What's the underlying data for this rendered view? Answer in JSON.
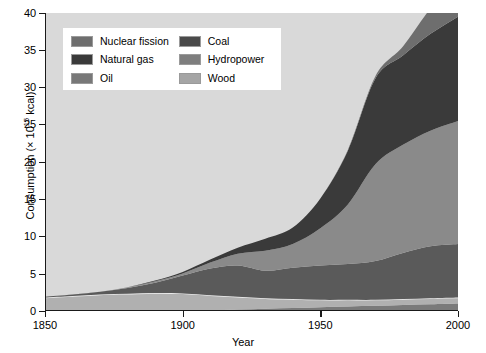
{
  "chart_data": {
    "type": "area",
    "title": "",
    "subtitle": "",
    "xlabel": "Year",
    "ylabel": "Consumption (× 10¹⁵ kcal)",
    "ylabel_prefix": "Consumption (× 10",
    "ylabel_exponent": "15",
    "ylabel_suffix": " kcal)",
    "xlim": [
      1850,
      2000
    ],
    "ylim": [
      0,
      40
    ],
    "xticks": [
      1850,
      1900,
      1950,
      2000
    ],
    "yticks": [
      0,
      5,
      10,
      15,
      20,
      25,
      30,
      35,
      40
    ],
    "grid": false,
    "stacked": true,
    "legend_position": "top-left-inside",
    "plot_background": "#d9d9d9",
    "x": [
      1850,
      1860,
      1870,
      1880,
      1890,
      1900,
      1910,
      1920,
      1930,
      1940,
      1950,
      1960,
      1970,
      1980,
      1990,
      2000
    ],
    "stack_order_bottom_to_top": [
      "Hydropower",
      "Wood",
      "Coal",
      "Oil",
      "Natural gas",
      "Nuclear fission"
    ],
    "series": [
      {
        "name": "Nuclear fission",
        "color": "#6e6e6e",
        "values": [
          0,
          0,
          0,
          0,
          0,
          0,
          0,
          0,
          0,
          0,
          0,
          0.1,
          0.3,
          1.2,
          3.4,
          5.0
        ]
      },
      {
        "name": "Natural gas",
        "color": "#3a3a3a",
        "values": [
          0,
          0,
          0,
          0,
          0.1,
          0.2,
          0.4,
          0.8,
          1.6,
          2.2,
          4.0,
          7.2,
          11.5,
          12.0,
          13.0,
          14.0
        ]
      },
      {
        "name": "Oil",
        "color": "#8a8a8a",
        "values": [
          0,
          0,
          0,
          0.1,
          0.2,
          0.3,
          0.8,
          1.6,
          2.7,
          3.2,
          5.0,
          8.0,
          13.0,
          14.5,
          15.5,
          16.5
        ]
      },
      {
        "name": "Coal",
        "color": "#5a5a5a",
        "values": [
          0.1,
          0.2,
          0.4,
          0.8,
          1.4,
          2.4,
          3.6,
          4.2,
          3.7,
          4.2,
          4.6,
          4.8,
          5.2,
          6.2,
          7.0,
          7.2
        ]
      },
      {
        "name": "Wood",
        "color": "#b0b0b0",
        "values": [
          1.8,
          2.0,
          2.2,
          2.3,
          2.4,
          2.3,
          2.0,
          1.7,
          1.4,
          1.2,
          1.0,
          0.9,
          0.8,
          0.8,
          0.8,
          0.8
        ]
      },
      {
        "name": "Hydropower",
        "color": "#7a7a7a",
        "values": [
          0,
          0,
          0,
          0,
          0,
          0.05,
          0.1,
          0.2,
          0.3,
          0.4,
          0.5,
          0.6,
          0.7,
          0.8,
          0.9,
          1.0
        ]
      }
    ],
    "totals": [
      1.9,
      2.2,
      2.6,
      3.2,
      4.1,
      5.25,
      6.9,
      8.5,
      9.7,
      11.2,
      15.1,
      21.6,
      31.5,
      35.5,
      40.6,
      44.5
    ],
    "annotations": []
  },
  "legend": {
    "items": [
      {
        "label": "Nuclear fission",
        "color": "#6e6e6e",
        "column": 1
      },
      {
        "label": "Natural gas",
        "color": "#3a3a3a",
        "column": 1
      },
      {
        "label": "Oil",
        "color": "#787878",
        "column": 1
      },
      {
        "label": "Coal",
        "color": "#4a4a4a",
        "column": 2
      },
      {
        "label": "Hydropower",
        "color": "#7e7e7e",
        "column": 2
      },
      {
        "label": "Wood",
        "color": "#a5a5a5",
        "column": 2
      }
    ]
  },
  "axes": {
    "y_tick_labels": [
      "40",
      "35",
      "30",
      "25",
      "20",
      "15",
      "10",
      "5",
      "0"
    ],
    "x_tick_labels": [
      "1850",
      "1900",
      "1950",
      "2000"
    ],
    "x_title": "Year"
  },
  "colors": {
    "plot_bg": "#d9d9d9",
    "axis": "#1a1a1a",
    "page_bg": "#ffffff",
    "wood_outline": "#f2f2f2"
  }
}
